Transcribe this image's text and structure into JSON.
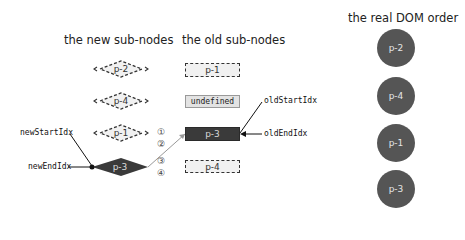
{
  "titles": {
    "new": "the new sub-nodes",
    "old": "the old sub-nodes",
    "dom": "the real DOM order"
  },
  "new_nodes": [
    {
      "label": "p-2",
      "style": "dashed"
    },
    {
      "label": "p-4",
      "style": "dashed"
    },
    {
      "label": "p-1",
      "style": "dashed"
    },
    {
      "label": "p-3",
      "style": "solid"
    }
  ],
  "old_nodes": [
    {
      "label": "p-1",
      "style": "dashed"
    },
    {
      "label": "undefined",
      "style": "undefined"
    },
    {
      "label": "p-3",
      "style": "solid"
    },
    {
      "label": "p-4",
      "style": "dashed"
    }
  ],
  "dom_nodes": [
    {
      "label": "p-2"
    },
    {
      "label": "p-4"
    },
    {
      "label": "p-1"
    },
    {
      "label": "p-3"
    }
  ],
  "pointers": {
    "new_start": "newStartIdx",
    "new_end": "newEndIdx",
    "old_start": "oldStartIdx",
    "old_end": "oldEndIdx"
  },
  "steps": [
    "①",
    "②",
    "③",
    "④"
  ],
  "colors": {
    "solid_node": "#3a3a3a",
    "dom_circle": "#555555",
    "dashed_fill": "#f1f1f1"
  }
}
